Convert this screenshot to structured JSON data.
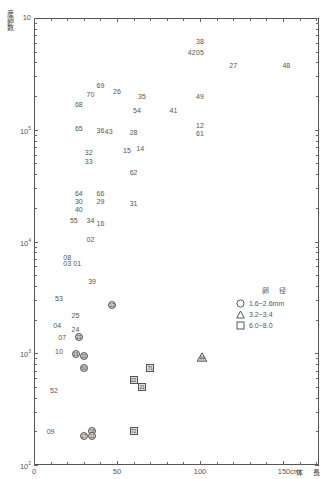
{
  "chart_data": {
    "type": "scatter",
    "title": "",
    "xlabel": "体 長",
    "ylabel": "産卵数",
    "x_unit": "cm",
    "y_scale": "log",
    "xlim": [
      0,
      172
    ],
    "ylim": [
      100,
      1000000
    ],
    "x_ticks": [
      0,
      50,
      100,
      150
    ],
    "x_tick_labels": [
      "0",
      "50",
      "100",
      "150cm"
    ],
    "y_ticks": [
      100,
      1000,
      10000,
      100000,
      1000000
    ],
    "y_tick_labels": [
      "10²",
      "10³",
      "10⁴",
      "10⁵",
      "10⁶"
    ],
    "grid": false,
    "legend": {
      "title": "卵 径",
      "position": "right-middle",
      "entries": [
        {
          "marker": "circle",
          "label": "1.6~2.6mm"
        },
        {
          "marker": "triangle",
          "label": "3.2~3.4"
        },
        {
          "marker": "square",
          "label": "6.0~8.0"
        }
      ]
    },
    "series": [
      {
        "name": "plain-label",
        "marker": "none",
        "points": [
          {
            "id": "38",
            "x": 100,
            "y": 620000
          },
          {
            "id": "42",
            "x": 95,
            "y": 500000
          },
          {
            "id": "05",
            "x": 100,
            "y": 500000
          },
          {
            "id": "27",
            "x": 120,
            "y": 380000
          },
          {
            "id": "48",
            "x": 152,
            "y": 380000
          },
          {
            "id": "69",
            "x": 40,
            "y": 250000
          },
          {
            "id": "26",
            "x": 50,
            "y": 220000
          },
          {
            "id": "70",
            "x": 34,
            "y": 210000
          },
          {
            "id": "35",
            "x": 65,
            "y": 200000
          },
          {
            "id": "49",
            "x": 100,
            "y": 200000
          },
          {
            "id": "68",
            "x": 27,
            "y": 170000
          },
          {
            "id": "54",
            "x": 62,
            "y": 150000
          },
          {
            "id": "41",
            "x": 84,
            "y": 150000
          },
          {
            "id": "12",
            "x": 100,
            "y": 110000
          },
          {
            "id": "65",
            "x": 27,
            "y": 103000
          },
          {
            "id": "36",
            "x": 40,
            "y": 100000
          },
          {
            "id": "43",
            "x": 45,
            "y": 97000
          },
          {
            "id": "28",
            "x": 60,
            "y": 96000
          },
          {
            "id": "61",
            "x": 100,
            "y": 93000
          },
          {
            "id": "15",
            "x": 56,
            "y": 66000
          },
          {
            "id": "14",
            "x": 64,
            "y": 68000
          },
          {
            "id": "32",
            "x": 33,
            "y": 63000
          },
          {
            "id": "33",
            "x": 33,
            "y": 53000
          },
          {
            "id": "62",
            "x": 60,
            "y": 42000
          },
          {
            "id": "64",
            "x": 27,
            "y": 27000
          },
          {
            "id": "66",
            "x": 40,
            "y": 27000
          },
          {
            "id": "30",
            "x": 27,
            "y": 23000
          },
          {
            "id": "29",
            "x": 40,
            "y": 23000
          },
          {
            "id": "31",
            "x": 60,
            "y": 22000
          },
          {
            "id": "40",
            "x": 27,
            "y": 19500
          },
          {
            "id": "55",
            "x": 24,
            "y": 15500
          },
          {
            "id": "34",
            "x": 34,
            "y": 15500
          },
          {
            "id": "16",
            "x": 40,
            "y": 14500
          },
          {
            "id": "02",
            "x": 34,
            "y": 10500
          },
          {
            "id": "08",
            "x": 20,
            "y": 7300
          },
          {
            "id": "03",
            "x": 20,
            "y": 6400
          },
          {
            "id": "01",
            "x": 26,
            "y": 6400
          },
          {
            "id": "39",
            "x": 35,
            "y": 4400
          },
          {
            "id": "53",
            "x": 15,
            "y": 3150
          },
          {
            "id": "25",
            "x": 25,
            "y": 2200
          },
          {
            "id": "04",
            "x": 14,
            "y": 1800
          },
          {
            "id": "24",
            "x": 25,
            "y": 1650
          },
          {
            "id": "07",
            "x": 17,
            "y": 1400
          },
          {
            "id": "10",
            "x": 15,
            "y": 1050
          },
          {
            "id": "52",
            "x": 12,
            "y": 470
          },
          {
            "id": "09",
            "x": 10,
            "y": 200
          }
        ]
      },
      {
        "name": "1.6~2.6mm",
        "marker": "circle",
        "points": [
          {
            "id": "13",
            "x": 47,
            "y": 2700
          },
          {
            "id": "23",
            "x": 27,
            "y": 1400
          },
          {
            "id": "19",
            "x": 25,
            "y": 980
          },
          {
            "id": "20",
            "x": 30,
            "y": 950
          },
          {
            "id": "60",
            "x": 30,
            "y": 740
          },
          {
            "id": "18",
            "x": 35,
            "y": 200
          },
          {
            "id": "17",
            "x": 30,
            "y": 182
          },
          {
            "id": "11",
            "x": 35,
            "y": 182
          }
        ]
      },
      {
        "name": "3.2~3.4",
        "marker": "triangle",
        "points": [
          {
            "id": "44",
            "x": 101,
            "y": 930
          }
        ]
      },
      {
        "name": "6.0~8.0",
        "marker": "square",
        "points": [
          {
            "id": "71",
            "x": 70,
            "y": 740
          },
          {
            "id": "22",
            "x": 60,
            "y": 580
          },
          {
            "id": "21",
            "x": 65,
            "y": 500
          },
          {
            "id": "72",
            "x": 60,
            "y": 200
          }
        ]
      }
    ]
  },
  "axes": {
    "ylabel": "産卵数",
    "xlabel": "体 長",
    "y_tick_labels": [
      {
        "base": "10",
        "exp": ""
      },
      {
        "base": "10",
        "exp": "4"
      },
      {
        "base": "10",
        "exp": "3"
      },
      {
        "base": "10",
        "exp": "2"
      },
      {
        "base": "10",
        "exp": "2"
      }
    ],
    "x_tick_labels": [
      "0",
      "50",
      "100",
      "150cm"
    ]
  },
  "legend": {
    "title": "卵 径",
    "entries": [
      "1.6~2.6mm",
      "3.2~3.4",
      "6.0~8.0"
    ]
  }
}
